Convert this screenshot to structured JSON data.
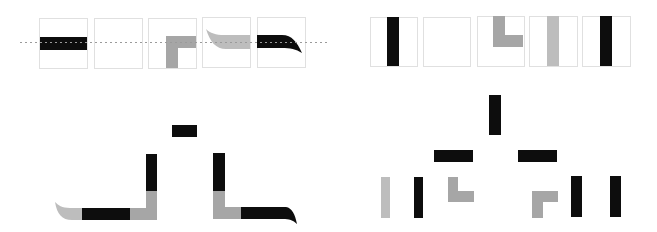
{
  "colors": {
    "background": "#ffffff",
    "black": "#0d0d0d",
    "gray": "#a6a6a6",
    "light_gray": "#bdbdbd",
    "box_border": "#e0e0e0",
    "baseline": "#9a9a9a"
  },
  "top_left_strip": {
    "description": "Five square cells with a dotted horizontal baseline passing through",
    "baseline": {
      "x1": 20,
      "x2": 328,
      "y": 42
    },
    "cells": [
      {
        "x": 39,
        "y": 18,
        "w": 48,
        "h": 50,
        "content": "black-horizontal-bar"
      },
      {
        "x": 94,
        "y": 18,
        "w": 48,
        "h": 50,
        "content": "empty"
      },
      {
        "x": 148,
        "y": 18,
        "w": 48,
        "h": 50,
        "content": "gray-corner-down-left"
      },
      {
        "x": 202,
        "y": 17,
        "w": 48,
        "h": 50,
        "content": "gray-swoosh-left"
      },
      {
        "x": 257,
        "y": 17,
        "w": 48,
        "h": 50,
        "content": "black-swoosh-right"
      }
    ]
  },
  "top_right_strip": {
    "description": "Five square cells with vertical strokes",
    "cells": [
      {
        "x": 370,
        "y": 17,
        "w": 47,
        "h": 49,
        "content": "black-vertical-bar"
      },
      {
        "x": 423,
        "y": 17,
        "w": 47,
        "h": 49,
        "content": "empty"
      },
      {
        "x": 477,
        "y": 16,
        "w": 47,
        "h": 50,
        "content": "gray-corner-up-right"
      },
      {
        "x": 529,
        "y": 16,
        "w": 48,
        "h": 50,
        "content": "light-gray-vertical-bar"
      },
      {
        "x": 582,
        "y": 16,
        "w": 48,
        "h": 50,
        "content": "black-vertical-bar"
      }
    ]
  },
  "bottom_left_assembly": {
    "description": "Pieces assembled into a composite glyph",
    "pieces": [
      {
        "name": "top-dot-bar",
        "color": "black",
        "x": 172,
        "y": 125,
        "w": 25,
        "h": 12
      },
      {
        "name": "left-tail",
        "color": "light_gray",
        "shape": "curved-tail-left"
      },
      {
        "name": "left-base-bar",
        "color": "black",
        "x": 82,
        "y": 208,
        "w": 48,
        "h": 12
      },
      {
        "name": "left-corner",
        "color": "gray",
        "shape": "corner"
      },
      {
        "name": "left-upright",
        "color": "black",
        "x": 146,
        "y": 154,
        "w": 11,
        "h": 37
      },
      {
        "name": "right-upright",
        "color": "black",
        "x": 213,
        "y": 153,
        "w": 12,
        "h": 38
      },
      {
        "name": "right-corner",
        "color": "gray",
        "shape": "corner"
      },
      {
        "name": "right-tail",
        "color": "black",
        "shape": "curved-tail-right"
      }
    ]
  },
  "bottom_right_tree": {
    "description": "Hierarchical decomposition tree of strokes",
    "levels": [
      {
        "level": 0,
        "nodes": [
          {
            "name": "root-vertical",
            "color": "black",
            "x": 489,
            "y": 95,
            "w": 12,
            "h": 40
          }
        ]
      },
      {
        "level": 1,
        "nodes": [
          {
            "name": "left-horizontal",
            "color": "black",
            "x": 434,
            "y": 150,
            "w": 39,
            "h": 12
          },
          {
            "name": "right-horizontal",
            "color": "black",
            "x": 518,
            "y": 150,
            "w": 39,
            "h": 12
          }
        ]
      },
      {
        "level": 2,
        "nodes": [
          {
            "name": "leaf-light-vertical",
            "color": "light_gray",
            "x": 381,
            "y": 177,
            "w": 9,
            "h": 41
          },
          {
            "name": "leaf-black-vertical-1",
            "color": "black",
            "x": 414,
            "y": 177,
            "w": 9,
            "h": 41
          },
          {
            "name": "leaf-gray-corner-1",
            "color": "gray",
            "shape": "corner-up-right"
          },
          {
            "name": "leaf-gray-corner-2",
            "color": "gray",
            "shape": "corner-down-right"
          },
          {
            "name": "leaf-black-vertical-2",
            "color": "black",
            "x": 571,
            "y": 176,
            "w": 11,
            "h": 41
          },
          {
            "name": "leaf-black-vertical-3",
            "color": "black",
            "x": 610,
            "y": 176,
            "w": 11,
            "h": 41
          }
        ]
      }
    ]
  }
}
